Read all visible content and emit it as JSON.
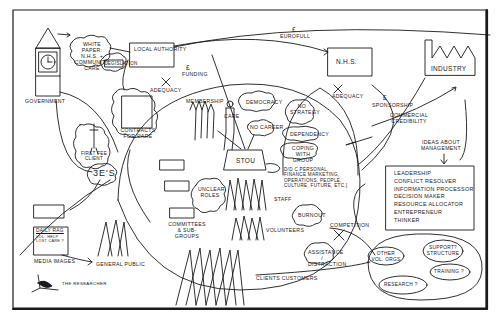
{
  "diagram": {
    "border_color": "#111111",
    "ink_color": "#1a1a1a",
    "background": "#ffffff",
    "nodes": {
      "government": "Government",
      "white_paper": "White paper: N.H.S. + community care",
      "legislation": "Legislation",
      "local_authority": "Local authority",
      "adequacy_1": "Adequacy",
      "funding_label": "Funding",
      "funding_symbol": "£",
      "contracts_for_care": "Contracts for care",
      "first_fee_client": "First fee client",
      "three_es": "3E'S",
      "eurofull": "Eurofull",
      "eurofull_symbol": "£",
      "nhs": "N.H.S.",
      "adequacy_2": "Adequacy",
      "industry": "Industry",
      "sponsorship": "Sponsorship",
      "sponsorship_symbol": "£",
      "commercial_credibility": "Commercial credibility",
      "ideas_about_management": "Ideas about management",
      "management_roles": [
        "Leadership",
        "Conflict resolver",
        "Information processor",
        "Decision maker",
        "Resource allocator",
        "Entrepreneur",
        "Thinker"
      ],
      "membership": "Membership",
      "care": "Care",
      "democracy": "Democracy",
      "no_career": "No career",
      "no_strategy": "No strategy",
      "dependency": "Dependency",
      "coping_with_group": "Coping with group",
      "stou": "STOU",
      "dilemmas": "D/D C Personal, finance marketing, operations, people, culture, future, etc.]",
      "unclear_roles": "Unclear roles",
      "committees": "Committees & Sub-groups",
      "staff": "Staff",
      "volunteers": "Volunteers",
      "burnout": "Burnout",
      "competition": "Competition",
      "assistance_distraction": "Assistance / distraction",
      "clients_customers": "Clients customers",
      "media": "Media images",
      "media_headline": "Daily Rag",
      "media_subtext": "Vol. help lost care ?",
      "general_public": "General public",
      "other_vol_orgs": "Other vol. orgs",
      "support_structure": "Support? structure",
      "research": "Research ?",
      "training": "Training ?",
      "the_researcher": "The Researcher"
    }
  }
}
